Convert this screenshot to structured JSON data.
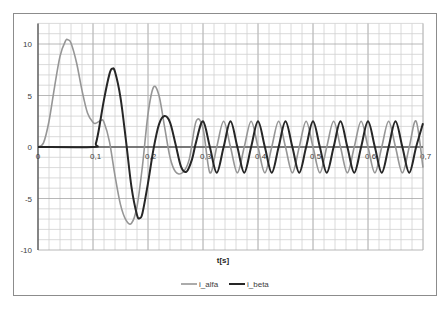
{
  "chart_data": {
    "type": "line",
    "title": "",
    "xlabel": "t[s]",
    "ylabel": "",
    "xlim": [
      0,
      0.7
    ],
    "ylim": [
      -10,
      12
    ],
    "x_ticks": [
      "0",
      "0,1",
      "0,2",
      "0,3",
      "0,4",
      "0,5",
      "0,6",
      "0,7"
    ],
    "y_ticks": [
      "10",
      "5",
      "0",
      "-5",
      "-10"
    ],
    "grid": true,
    "legend_position": "bottom",
    "series": [
      {
        "name": "i_alfa",
        "color": "#969696",
        "line_width": 1.6,
        "points": [
          [
            0,
            0
          ],
          [
            0.01,
            0.4
          ],
          [
            0.02,
            2.5
          ],
          [
            0.03,
            5.8
          ],
          [
            0.04,
            8.8
          ],
          [
            0.05,
            10.3
          ],
          [
            0.055,
            10.4
          ],
          [
            0.06,
            10.1
          ],
          [
            0.07,
            8.2
          ],
          [
            0.08,
            5.5
          ],
          [
            0.09,
            3.3
          ],
          [
            0.1,
            2.4
          ],
          [
            0.105,
            2.3
          ],
          [
            0.115,
            2.6
          ],
          [
            0.12,
            2.4
          ],
          [
            0.13,
            0.5
          ],
          [
            0.14,
            -2.8
          ],
          [
            0.15,
            -5.6
          ],
          [
            0.16,
            -7.1
          ],
          [
            0.17,
            -7.4
          ],
          [
            0.18,
            -5.8
          ],
          [
            0.19,
            -1.8
          ],
          [
            0.2,
            3.2
          ],
          [
            0.21,
            5.8
          ],
          [
            0.22,
            5.0
          ],
          [
            0.23,
            2.0
          ],
          [
            0.24,
            -1.0
          ],
          [
            0.25,
            -2.4
          ],
          [
            0.2625,
            -2.5
          ],
          [
            0.275,
            -1.2
          ],
          [
            0.2875,
            2.5
          ],
          [
            0.3,
            1.8
          ],
          [
            0.3125,
            -2.5
          ],
          [
            0.325,
            0
          ],
          [
            0.3375,
            2.5
          ],
          [
            0.35,
            0
          ],
          [
            0.3625,
            -2.5
          ],
          [
            0.375,
            0
          ],
          [
            0.3875,
            2.5
          ],
          [
            0.4,
            0
          ],
          [
            0.4125,
            -2.5
          ],
          [
            0.425,
            0
          ],
          [
            0.4375,
            2.5
          ],
          [
            0.45,
            0
          ],
          [
            0.4625,
            -2.5
          ],
          [
            0.475,
            0
          ],
          [
            0.4875,
            2.5
          ],
          [
            0.5,
            0
          ],
          [
            0.5125,
            -2.5
          ],
          [
            0.525,
            0
          ],
          [
            0.5375,
            2.5
          ],
          [
            0.55,
            0
          ],
          [
            0.5625,
            -2.5
          ],
          [
            0.575,
            0
          ],
          [
            0.5875,
            2.5
          ],
          [
            0.6,
            0
          ],
          [
            0.6125,
            -2.5
          ],
          [
            0.625,
            0
          ],
          [
            0.6375,
            2.5
          ],
          [
            0.65,
            0
          ],
          [
            0.6625,
            -2.5
          ],
          [
            0.675,
            0
          ],
          [
            0.6875,
            2.5
          ],
          [
            0.7,
            -2.0
          ]
        ]
      },
      {
        "name": "i_beta",
        "color": "#262626",
        "line_width": 2.0,
        "points": [
          [
            0,
            0
          ],
          [
            0.1,
            0
          ],
          [
            0.105,
            0.3
          ],
          [
            0.11,
            1.5
          ],
          [
            0.12,
            4.6
          ],
          [
            0.13,
            7.1
          ],
          [
            0.135,
            7.6
          ],
          [
            0.14,
            7.3
          ],
          [
            0.15,
            4.8
          ],
          [
            0.16,
            0.6
          ],
          [
            0.17,
            -3.9
          ],
          [
            0.18,
            -6.6
          ],
          [
            0.185,
            -6.9
          ],
          [
            0.19,
            -6.4
          ],
          [
            0.2,
            -3.5
          ],
          [
            0.21,
            -0.2
          ],
          [
            0.22,
            2.2
          ],
          [
            0.23,
            3.0
          ],
          [
            0.24,
            2.4
          ],
          [
            0.25,
            0.3
          ],
          [
            0.26,
            -1.9
          ],
          [
            0.27,
            -2.4
          ],
          [
            0.28,
            -1.2
          ],
          [
            0.2875,
            0.5
          ],
          [
            0.3,
            2.5
          ],
          [
            0.3125,
            0
          ],
          [
            0.325,
            -2.5
          ],
          [
            0.3375,
            0
          ],
          [
            0.35,
            2.5
          ],
          [
            0.3625,
            0
          ],
          [
            0.375,
            -2.5
          ],
          [
            0.3875,
            0
          ],
          [
            0.4,
            2.5
          ],
          [
            0.4125,
            0
          ],
          [
            0.425,
            -2.5
          ],
          [
            0.4375,
            0
          ],
          [
            0.45,
            2.5
          ],
          [
            0.4625,
            0
          ],
          [
            0.475,
            -2.5
          ],
          [
            0.4875,
            0
          ],
          [
            0.5,
            2.5
          ],
          [
            0.5125,
            0
          ],
          [
            0.525,
            -2.5
          ],
          [
            0.5375,
            0
          ],
          [
            0.55,
            2.5
          ],
          [
            0.5625,
            0
          ],
          [
            0.575,
            -2.5
          ],
          [
            0.5875,
            0
          ],
          [
            0.6,
            2.5
          ],
          [
            0.6125,
            0
          ],
          [
            0.625,
            -2.5
          ],
          [
            0.6375,
            0
          ],
          [
            0.65,
            2.5
          ],
          [
            0.6625,
            0
          ],
          [
            0.675,
            -2.5
          ],
          [
            0.6875,
            0
          ],
          [
            0.7,
            2.3
          ]
        ]
      }
    ]
  },
  "legend": {
    "items": [
      {
        "label": "i_alfa",
        "color": "#969696"
      },
      {
        "label": "i_beta",
        "color": "#262626"
      }
    ]
  },
  "colors": {
    "grid": "#d0d0d0",
    "axis": "#595959",
    "frame": "#8c8c8c"
  }
}
